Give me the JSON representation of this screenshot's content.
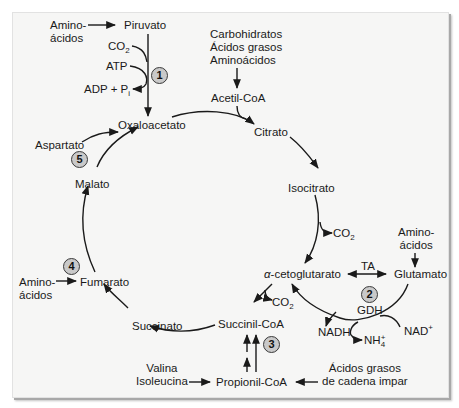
{
  "figure": {
    "metabolites": {
      "amino_acids_top": "Amino-",
      "amino_acids_top_2": "ácidos",
      "pyruvate": "Piruvato",
      "co2_top": "CO",
      "co2_top_sub": "2",
      "atp": "ATP",
      "adp_pi": "ADP + P",
      "adp_pi_sub": "i",
      "carbohydrates": "Carbohidratos",
      "fatty_acids": "Ácidos grasos",
      "amino_acids_list": "Aminoácidos",
      "acetyl_coa": "Acetil-CoA",
      "oxaloacetate": "Oxaloacetato",
      "citrate": "Citrato",
      "aspartate": "Aspartato",
      "malate": "Malato",
      "isocitrate": "Isocitrato",
      "co2_isocitrate": "CO",
      "co2_isocitrate_sub": "2",
      "amino_acids_right": "Amino-",
      "amino_acids_right_2": "ácidos",
      "alpha_kg_prefix": "α",
      "alpha_kg": "-cetoglutarato",
      "glutamate": "Glutamato",
      "ta": "TA",
      "gdh": "GDH",
      "amino_acids_left": "Amino-",
      "amino_acids_left_2": "ácidos",
      "fumarate": "Fumarato",
      "co2_succinyl": "CO",
      "co2_succinyl_sub": "2",
      "nadh": "NADH",
      "nad": "NAD",
      "nad_sup": "+",
      "nh4": "NH",
      "nh4_sup": "+",
      "nh4_sub": "4",
      "succinate": "Succinato",
      "succinyl_coa": "Succinil-CoA",
      "valine": "Valina",
      "isoleucine": "Isoleucina",
      "propionyl_coa": "Propionil-CoA",
      "odd_fatty_acids_1": "Ácidos grasos",
      "odd_fatty_acids_2": "de cadena impar"
    },
    "badges": [
      "1",
      "2",
      "3",
      "4",
      "5"
    ],
    "colors": {
      "panel_bg": "#f6f6f5",
      "badge_fill": "#c9c9c9",
      "arrow": "#1a1a1a"
    }
  }
}
